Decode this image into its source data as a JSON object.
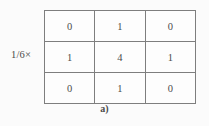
{
  "figure": {
    "scalar_label": "1/6×",
    "caption": "a)",
    "border_color": "#7e7e7e",
    "text_color": "#4b4b4b",
    "background_color": "#fbfbfb"
  },
  "chart_data": {
    "type": "table",
    "caption": "a)",
    "scalar_multiplier": "1/6×",
    "rows": 3,
    "cols": 3,
    "matrix": [
      [
        0,
        1,
        0
      ],
      [
        1,
        4,
        1
      ],
      [
        0,
        1,
        0
      ]
    ],
    "cells": [
      {
        "row": 0,
        "col": 0,
        "value": "0"
      },
      {
        "row": 0,
        "col": 1,
        "value": "1"
      },
      {
        "row": 0,
        "col": 2,
        "value": "0"
      },
      {
        "row": 1,
        "col": 0,
        "value": "1"
      },
      {
        "row": 1,
        "col": 1,
        "value": "4"
      },
      {
        "row": 1,
        "col": 2,
        "value": "1"
      },
      {
        "row": 2,
        "col": 0,
        "value": "0"
      },
      {
        "row": 2,
        "col": 1,
        "value": "1"
      },
      {
        "row": 2,
        "col": 2,
        "value": "0"
      }
    ],
    "xlabel": "",
    "ylabel": "",
    "grid": true,
    "legend": null
  }
}
